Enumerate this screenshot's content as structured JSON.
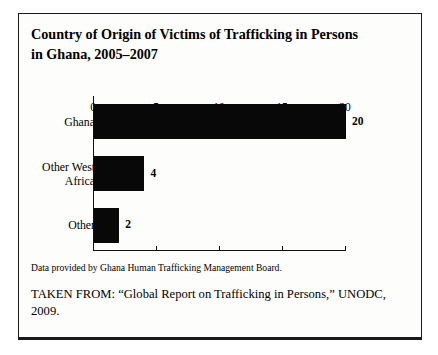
{
  "figure": {
    "title": "Country of Origin of Victims of Trafficking in Persons in Ghana, 2005–2007",
    "source_note": "Data provided by Ghana Human Trafficking Management Board.",
    "taken_from": "TAKEN FROM: “Global Report on Trafficking in Persons,” UNODC, 2009.",
    "border_color": "#1a1a1a",
    "bar_color": "#080808",
    "background": "#fdfdfc"
  },
  "chart_data": {
    "type": "bar",
    "orientation": "horizontal",
    "title": "Country of Origin of Victims of Trafficking in Persons in Ghana, 2005–2007",
    "categories": [
      "Ghana",
      "Other West Africa",
      "Other"
    ],
    "values": [
      20,
      4,
      2
    ],
    "data_labels": [
      "20",
      "4",
      "2"
    ],
    "xlabel": "",
    "ylabel": "",
    "xlim": [
      0,
      20
    ],
    "xticks": [
      0,
      5,
      10,
      15,
      20
    ],
    "xtick_labels": [
      "0",
      "5",
      "10",
      "15",
      "20"
    ],
    "grid": false,
    "legend": false
  }
}
